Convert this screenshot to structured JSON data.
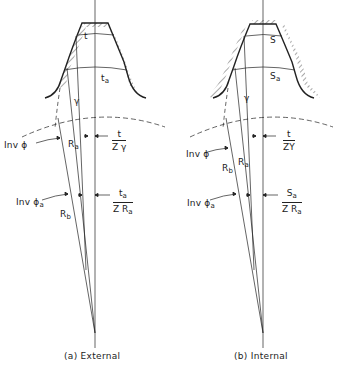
{
  "figure": {
    "panels": [
      {
        "id": "external",
        "caption": "(a) External",
        "labels": {
          "tooth_thickness": "t",
          "tooth_thickness_at_a": "t",
          "tooth_thickness_at_a_sub": "a",
          "pitch_radius": "γ",
          "inv_phi": "Inv ϕ",
          "inv_phi_a": "Inv ϕ",
          "inv_phi_a_sub": "a",
          "radius_a": "R",
          "radius_a_sub": "a",
          "radius_b": "R",
          "radius_b_sub": "b",
          "frac1_num": "t",
          "frac1_den": "Z γ",
          "frac2_num": "t",
          "frac2_num_sub": "a",
          "frac2_den": "Z R",
          "frac2_den_sub": "a"
        }
      },
      {
        "id": "internal",
        "caption": "(b) Internal",
        "labels": {
          "tooth_thickness": "S",
          "tooth_thickness_at_a": "S",
          "tooth_thickness_at_a_sub": "a",
          "pitch_radius": "γ",
          "inv_phi": "Inv ϕ",
          "inv_phi_a": "Inv ϕ",
          "inv_phi_a_sub": "a",
          "radius_a": "R",
          "radius_a_sub": "a",
          "radius_b": "R",
          "radius_b_sub": "b",
          "frac1_num": "t",
          "frac1_den": "ZY",
          "frac2_num": "S",
          "frac2_num_sub": "a",
          "frac2_den": "Z R",
          "frac2_den_sub": "a"
        }
      }
    ],
    "colors": {
      "line": "#222222",
      "background": "#ffffff"
    }
  }
}
